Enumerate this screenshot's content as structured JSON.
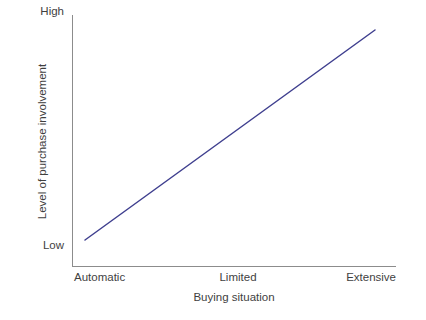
{
  "chart_data": {
    "type": "line",
    "title": "",
    "subtitle": "",
    "xlabel": "Buying situation",
    "ylabel": "Level of purchase involvement",
    "x_tick_labels": [
      "Automatic",
      "Limited",
      "Extensive"
    ],
    "y_tick_labels": [
      "Low",
      "High"
    ],
    "x": [
      "Automatic",
      "Limited",
      "Extensive"
    ],
    "xlim": [
      "Automatic",
      "Extensive"
    ],
    "ylim": [
      "Low",
      "High"
    ],
    "grid": false,
    "legend": false,
    "legend_position": "none",
    "annotations": [],
    "series": [
      {
        "name": "Purchase involvement",
        "values": [
          "Low",
          "Medium",
          "High"
        ],
        "normalized_values": [
          0.09,
          0.52,
          0.94
        ],
        "color": "#3f3f8f",
        "line_width": 1.5,
        "style": "solid",
        "markers": false
      }
    ]
  },
  "axes": {
    "y_top_label": "High",
    "y_bottom_label": "Low",
    "y_title": "Level of purchase involvement",
    "x_left_label": "Automatic",
    "x_center_label": "Limited",
    "x_right_label": "Extensive",
    "x_title": "Buying situation"
  },
  "caption": {
    "text": ""
  },
  "colors": {
    "line": "#3f3f8f",
    "axis": "#8c8c8c",
    "text": "#3f3f3f",
    "background": "#ffffff"
  }
}
